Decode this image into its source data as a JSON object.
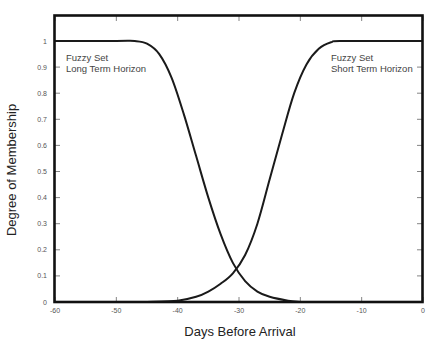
{
  "chart_data": {
    "type": "line",
    "title": "",
    "xlabel": "Days Before Arrival",
    "ylabel": "Degree of Membership",
    "xlim": [
      -60,
      0
    ],
    "ylim": [
      0,
      1.1
    ],
    "grid": false,
    "legend_position": "none",
    "x_ticks": [
      -60,
      -50,
      -40,
      -30,
      -20,
      -10,
      0
    ],
    "x_tick_labels": [
      "-60",
      "-50",
      "-40",
      "-30",
      "-20",
      "-10",
      "0"
    ],
    "y_ticks": [
      0,
      0.1,
      0.2,
      0.3,
      0.4,
      0.5,
      0.6,
      0.7,
      0.8,
      0.9,
      1
    ],
    "y_tick_labels": [
      "0",
      "0.1",
      "0.2",
      "0.3",
      "0.4",
      "0.5",
      "0.6",
      "0.7",
      "0.8",
      "0.9",
      "1"
    ],
    "series": [
      {
        "name": "Fuzzy Set Long Term Horizon",
        "x": [
          -60,
          -50,
          -47,
          -45,
          -43,
          -41,
          -39,
          -37,
          -35,
          -33,
          -31,
          -29,
          -27,
          -25,
          -22,
          -20
        ],
        "y": [
          1,
          1,
          1,
          0.99,
          0.95,
          0.86,
          0.72,
          0.56,
          0.4,
          0.26,
          0.15,
          0.08,
          0.04,
          0.02,
          0.005,
          0
        ]
      },
      {
        "name": "Fuzzy Set Short Term Horizon",
        "x": [
          -45,
          -40,
          -37,
          -35,
          -33,
          -31,
          -29,
          -27,
          -25,
          -23,
          -21,
          -19,
          -17,
          -15,
          -13,
          0
        ],
        "y": [
          0,
          0.005,
          0.02,
          0.04,
          0.07,
          0.11,
          0.18,
          0.3,
          0.47,
          0.64,
          0.8,
          0.91,
          0.97,
          0.995,
          1,
          1
        ]
      }
    ],
    "annotations": [
      {
        "lines": [
          "Fuzzy Set",
          "Long Term Horizon"
        ],
        "x": -57.5,
        "y": 0.95
      },
      {
        "lines": [
          "Fuzzy Set",
          "Short Term Horizon"
        ],
        "x": -13.5,
        "y": 0.95
      }
    ],
    "crossing_point": {
      "x": -30,
      "y": 0.11
    }
  },
  "labels": {
    "xlabel": "Days Before Arrival",
    "ylabel": "Degree of Membership",
    "annot_long_1": "Fuzzy Set",
    "annot_long_2": "Long Term Horizon",
    "annot_short_1": "Fuzzy Set",
    "annot_short_2": "Short Term Horizon"
  }
}
